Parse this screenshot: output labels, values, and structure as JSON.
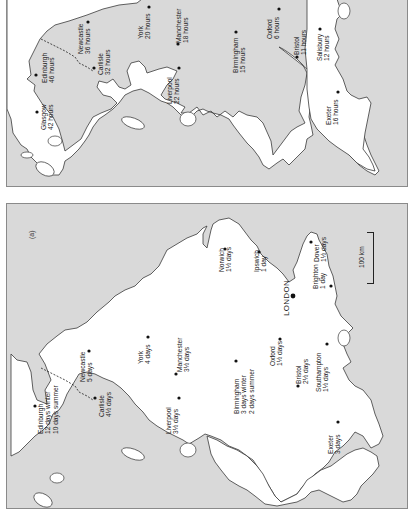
{
  "figure": {
    "orientation": "rotated 90 degrees counter-clockwise",
    "land_color": "#ffffff",
    "sea_color": "#d9d9d9",
    "panels": [
      {
        "id": "b",
        "label": "",
        "unit": "hours",
        "cities": [
          {
            "name": "Glasgow",
            "time": "42 hours"
          },
          {
            "name": "Edinburgh",
            "time": "46 hours"
          },
          {
            "name": "Newcastle",
            "time": "36 hours"
          },
          {
            "name": "Carlisle",
            "time": "32 hours"
          },
          {
            "name": "York",
            "time": "20 hours"
          },
          {
            "name": "Manchester",
            "time": "18 hours"
          },
          {
            "name": "Liverpool",
            "time": "22 hours"
          },
          {
            "name": "Birmingham",
            "time": "15 hours"
          },
          {
            "name": "Oxford",
            "time": "6 hours"
          },
          {
            "name": "Bristol",
            "time": "11 hours"
          },
          {
            "name": "Salisbury",
            "time": "12 hours"
          },
          {
            "name": "Exeter",
            "time": "16 hours"
          }
        ]
      },
      {
        "id": "a",
        "label": "(a)",
        "unit": "days",
        "cities": [
          {
            "name": "Edinburgh",
            "time": "12 days winter",
            "time2": "10 days summer"
          },
          {
            "name": "Newcastle",
            "time": "5 days"
          },
          {
            "name": "Carlisle",
            "time": "4½ days"
          },
          {
            "name": "York",
            "time": "4 days"
          },
          {
            "name": "Manchester",
            "time": "3½ days"
          },
          {
            "name": "Liverpool",
            "time": "3½ days"
          },
          {
            "name": "Birmingham",
            "time": "3 days winter",
            "time2": "2 days summer"
          },
          {
            "name": "Oxford",
            "time": "1½ days"
          },
          {
            "name": "Bristol",
            "time": "2½ days"
          },
          {
            "name": "Southampton",
            "time": "1½ days"
          },
          {
            "name": "Exeter",
            "time": "3 days"
          },
          {
            "name": "Norwich",
            "time": "1½ days"
          },
          {
            "name": "Ipswich",
            "time": "1 day"
          },
          {
            "name": "LONDON",
            "time": ""
          },
          {
            "name": "Brighton",
            "time": "1 day"
          },
          {
            "name": "Dover",
            "time": "1½ days"
          }
        ],
        "scale_bar": "100 km"
      }
    ]
  }
}
